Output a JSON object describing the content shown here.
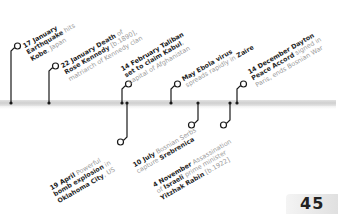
{
  "timeline": {
    "events_above": [
      {
        "date": "17 January",
        "parts": [
          "Earthquake",
          " hits ",
          "Kobe",
          ", Japan"
        ]
      },
      {
        "date": "22 January",
        "parts": [
          "Death",
          " of ",
          "Rose Kennedy",
          " [b.1890], matriarch of Kennedy clan"
        ]
      },
      {
        "date": "14 February",
        "parts": [
          "Taliban set to claim",
          " ",
          "Kabul",
          ", capital of Afghanistan"
        ]
      },
      {
        "date": "May",
        "parts": [
          "Ebola virus",
          " spreads rapidly in ",
          "Zaire",
          ""
        ]
      },
      {
        "date": "14 December",
        "parts": [
          "Dayton Peace Accord",
          " signed in Paris, ends Bosnian War",
          "",
          ""
        ]
      }
    ],
    "events_below": [
      {
        "date": "19 April",
        "parts": [
          "Powerful ",
          "bomb explosion",
          " in ",
          "Oklahoma City",
          ", US"
        ]
      },
      {
        "date": "10 July",
        "parts": [
          "Bosnian Serbs capture ",
          "Srebrenica",
          "",
          "",
          ""
        ]
      },
      {
        "date": "4 November",
        "parts": [
          "Assassination of ",
          "Israeli",
          " prime minister ",
          "Yitzhak Rabin",
          " [b.1922]"
        ]
      }
    ]
  },
  "labels": {
    "e1_l1": "17 January",
    "e1_l2a": "Earthquake",
    "e1_l2b": " hits",
    "e1_l3a": "Kobe",
    "e1_l3b": ", Japan",
    "e2_l1a": "22 January",
    "e2_l1b": " Death",
    "e2_l1c": " of",
    "e2_l2a": "Rose Kennedy",
    "e2_l2b": " [b.1890],",
    "e2_l3": "matriarch of Kennedy clan",
    "e3_l1": "14 February Taliban",
    "e3_l2a": "set to claim ",
    "e3_l2b": "Kabul",
    "e3_l2c": ",",
    "e3_l3": "capital of Afghanistan",
    "e4_l1a": "May",
    "e4_l1b": " Ebola virus",
    "e4_l2a": "spreads rapidly in ",
    "e4_l2b": "Zaire",
    "e5_l1a": "14 December",
    "e5_l1b": " Dayton",
    "e5_l2a": "Peace Accord",
    "e5_l2b": " signed in",
    "e5_l3": "Paris, ends Bosnian War",
    "e6_l1a": "19 April",
    "e6_l1b": " Powerful",
    "e6_l2a": "bomb explosion",
    "e6_l2b": " in",
    "e6_l3a": "Oklahoma City",
    "e6_l3b": ", US",
    "e7_l1a": "10 July",
    "e7_l1b": " Bosnian Serbs",
    "e7_l2a": "capture ",
    "e7_l2b": "Srebrenica",
    "e8_l1a": "4 November",
    "e8_l1b": " Assassination",
    "e8_l2a": "of ",
    "e8_l2b": "Israeli",
    "e8_l2c": " prime minister",
    "e8_l3a": "Yitzhak Rabin",
    "e8_l3b": " [b.1922]"
  },
  "page": {
    "number": "45"
  }
}
